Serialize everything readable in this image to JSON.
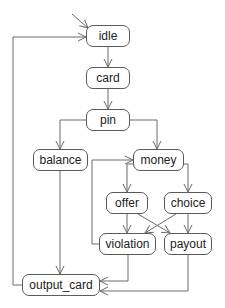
{
  "diagram": {
    "type": "state-machine",
    "colors": {
      "edge": "#6a6a6a",
      "node_border": "#5a5a5a",
      "text": "#222222",
      "background": "#ffffff"
    },
    "nodes": {
      "idle": "idle",
      "card": "card",
      "pin": "pin",
      "balance": "balance",
      "money": "money",
      "offer": "offer",
      "choice": "choice",
      "violation": "violation",
      "payout": "payout",
      "output_card": "output_card"
    },
    "edges": [
      {
        "from": "initial",
        "to": "idle"
      },
      {
        "from": "idle",
        "to": "card"
      },
      {
        "from": "card",
        "to": "pin"
      },
      {
        "from": "pin",
        "to": "balance"
      },
      {
        "from": "pin",
        "to": "money"
      },
      {
        "from": "balance",
        "to": "output_card"
      },
      {
        "from": "money",
        "to": "offer"
      },
      {
        "from": "money",
        "to": "choice"
      },
      {
        "from": "offer",
        "to": "violation"
      },
      {
        "from": "offer",
        "to": "payout"
      },
      {
        "from": "choice",
        "to": "violation"
      },
      {
        "from": "choice",
        "to": "payout"
      },
      {
        "from": "violation",
        "to": "money"
      },
      {
        "from": "violation",
        "to": "output_card"
      },
      {
        "from": "payout",
        "to": "output_card"
      },
      {
        "from": "output_card",
        "to": "idle"
      }
    ]
  }
}
